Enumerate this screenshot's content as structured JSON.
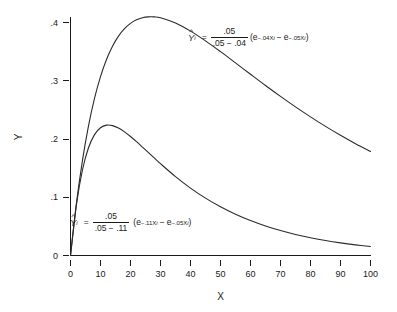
{
  "chart_data": {
    "type": "line",
    "title": "",
    "subtitle": "",
    "xlabel": "X",
    "ylabel": "Y",
    "xlim": [
      0,
      100
    ],
    "ylim": [
      0,
      0.42
    ],
    "xticks": [
      0,
      10,
      20,
      30,
      40,
      50,
      60,
      70,
      80,
      90,
      100
    ],
    "xticklabels": [
      "0",
      "10",
      "20",
      "30",
      "40",
      "50",
      "60",
      "70",
      "80",
      "90",
      "100"
    ],
    "yticks": [
      0,
      0.1,
      0.2,
      0.3,
      0.4
    ],
    "yticklabels": [
      "0",
      ".1",
      ".2",
      ".3",
      ".4"
    ],
    "grid": false,
    "legend": "none",
    "line_color": "#2b2b2b",
    "background_color": "#ffffff",
    "series": [
      {
        "name": "upper-curve",
        "formula_text": "Ŷi = .05/(.05 - .04)(e^(-.04Xi) - e^(-.05Xi))",
        "k_numerator": ".05",
        "k_denominator_a": ".05",
        "k_denominator_b": ".04",
        "exp_rate_1": ".04",
        "exp_rate_2": ".05",
        "peak_x": 22.3,
        "peak_y": 0.406,
        "x": [
          0,
          2,
          4,
          6,
          8,
          10,
          12,
          14,
          16,
          18,
          20,
          22,
          24,
          26,
          28,
          30,
          35,
          40,
          45,
          50,
          55,
          60,
          65,
          70,
          75,
          80,
          85,
          90,
          95,
          100
        ],
        "values": [
          0,
          0.0904,
          0.1636,
          0.2225,
          0.2697,
          0.3071,
          0.3365,
          0.3593,
          0.3766,
          0.3894,
          0.3985,
          0.4046,
          0.4082,
          0.4097,
          0.4096,
          0.4081,
          0.3991,
          0.3852,
          0.3684,
          0.3499,
          0.3306,
          0.3111,
          0.2918,
          0.2731,
          0.2551,
          0.238,
          0.2217,
          0.2064,
          0.1919,
          0.1784
        ]
      },
      {
        "name": "lower-curve",
        "formula_text": "Ŷi = .05/(.05 - .11)(e^(-.11Xi) - e^(-.05Xi))",
        "k_numerator": ".05",
        "k_denominator_a": ".05",
        "k_denominator_b": ".11",
        "exp_rate_1": ".11",
        "exp_rate_2": ".05",
        "peak_x": 13.1,
        "peak_y": 0.2346,
        "x": [
          0,
          2,
          4,
          6,
          8,
          10,
          12,
          14,
          16,
          18,
          20,
          22,
          24,
          26,
          28,
          30,
          35,
          40,
          45,
          50,
          55,
          60,
          65,
          70,
          75,
          80,
          85,
          90,
          95,
          100
        ],
        "values": [
          0,
          0.0883,
          0.1472,
          0.1849,
          0.2075,
          0.2194,
          0.2238,
          0.223,
          0.2188,
          0.2123,
          0.2043,
          0.1954,
          0.186,
          0.1765,
          0.167,
          0.1576,
          0.1355,
          0.1157,
          0.0985,
          0.0836,
          0.0708,
          0.0599,
          0.0506,
          0.0428,
          0.0361,
          0.0305,
          0.0257,
          0.0217,
          0.0183,
          0.0154
        ]
      }
    ],
    "annotations": [
      {
        "name": "formula-upper",
        "lhs": "Y",
        "lhs_sub": "i",
        "equals": "=",
        "numerator": ".05",
        "denominator": ".05 − .04",
        "open_paren": "(",
        "term1_base": "e",
        "term1_exp": "−.04X",
        "term1_exp_sub": "i",
        "minus": "−",
        "term2_base": "e",
        "term2_exp": "−.05X",
        "term2_exp_sub": "i",
        "close_paren": ")"
      },
      {
        "name": "formula-lower",
        "lhs": "Y",
        "lhs_sub": "i",
        "equals": "=",
        "numerator": ".05",
        "denominator": ".05 − .11",
        "open_paren": "(",
        "term1_base": "e",
        "term1_exp": "−.11X",
        "term1_exp_sub": "i",
        "minus": "−",
        "term2_base": "e",
        "term2_exp": "−.05X",
        "term2_exp_sub": "i",
        "close_paren": ")"
      }
    ]
  },
  "axes": {
    "x_title": "X",
    "y_title": "Y",
    "x_tick_labels": [
      "0",
      "10",
      "20",
      "30",
      "40",
      "50",
      "60",
      "70",
      "80",
      "90",
      "100"
    ],
    "y_tick_labels": [
      "0",
      ".1",
      ".2",
      ".3",
      ".4"
    ]
  },
  "caption": ""
}
